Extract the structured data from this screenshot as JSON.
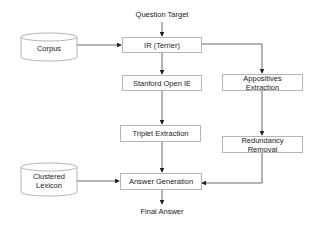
{
  "diagram": {
    "inputs": {
      "question_target": "Question Target",
      "corpus": "Corpus",
      "clustered_lexicon_line1": "Clustered",
      "clustered_lexicon_line2": "Lexicon"
    },
    "nodes": {
      "ir": "IR (Terrier)",
      "stanford": "Stanford Open IE",
      "triplet": "Triplet Extraction",
      "answer_gen": "Answer Generation",
      "appositives_line1": "Appositives",
      "appositives_line2": "Extraction",
      "redundancy_line1": "Redundancy",
      "redundancy_line2": "Removal"
    },
    "output": "Final Answer",
    "edges": [
      [
        "Question Target",
        "IR (Terrier)"
      ],
      [
        "Corpus",
        "IR (Terrier)"
      ],
      [
        "IR (Terrier)",
        "Stanford Open IE"
      ],
      [
        "IR (Terrier)",
        "Appositives Extraction"
      ],
      [
        "Stanford Open IE",
        "Triplet Extraction"
      ],
      [
        "Triplet Extraction",
        "Answer Generation"
      ],
      [
        "Appositives Extraction",
        "Redundancy Removal"
      ],
      [
        "Redundancy Removal",
        "Answer Generation"
      ],
      [
        "Clustered Lexicon",
        "Answer Generation"
      ],
      [
        "Answer Generation",
        "Final Answer"
      ]
    ],
    "colors": {
      "stroke": "#b5b5b5",
      "line": "#444444",
      "text": "#222222"
    }
  }
}
